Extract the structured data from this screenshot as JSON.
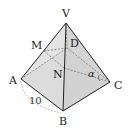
{
  "diagram": {
    "type": "square pyramid",
    "vertices": {
      "V": {
        "label": "V",
        "x": 66,
        "y": 23
      },
      "A": {
        "label": "A",
        "x": 21,
        "y": 79
      },
      "B": {
        "label": "B",
        "x": 63,
        "y": 111
      },
      "C": {
        "label": "C",
        "x": 110,
        "y": 82
      },
      "D": {
        "label": "D",
        "x": 67,
        "y": 48
      },
      "M": {
        "label": "M",
        "x": 44,
        "y": 51
      },
      "N": {
        "label": "N",
        "x": 64,
        "y": 68
      }
    },
    "edge_length_label": "10",
    "angle_label": "α",
    "colors": {
      "face_fill": "#d9d9d9",
      "edge": "#222222",
      "hidden": "#777777"
    }
  }
}
